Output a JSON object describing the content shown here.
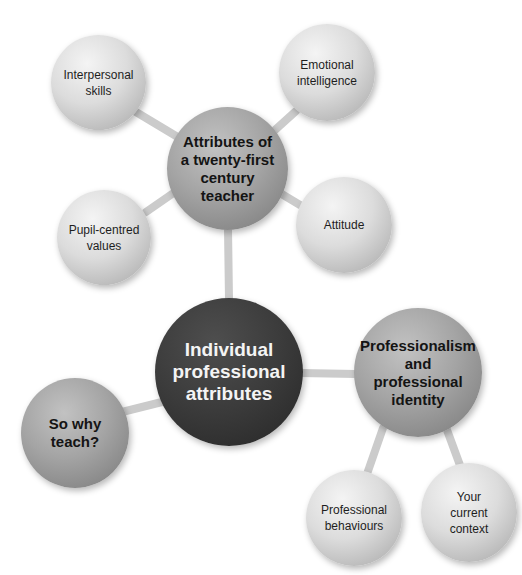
{
  "diagram": {
    "type": "mind-map",
    "colors": {
      "background": "#ffffff",
      "connector": "#cacaca",
      "center_node": "#3a3a3a",
      "primary_node": "#9a9a9a",
      "secondary_node": "#d2d2d2"
    },
    "center": {
      "id": "individual",
      "label": "Individual\nprofessional\nattributes"
    },
    "nodes": [
      {
        "id": "attributes",
        "label": "Attributes of\na twenty-first\ncentury\nteacher",
        "level": "primary",
        "parent": "individual"
      },
      {
        "id": "professionalism",
        "label": "Professionalism\nand professional\nidentity",
        "level": "primary",
        "parent": "individual"
      },
      {
        "id": "so-why-teach",
        "label": "So why\nteach?",
        "level": "primary",
        "parent": "individual"
      },
      {
        "id": "interpersonal",
        "label": "Interpersonal\nskills",
        "level": "secondary",
        "parent": "attributes"
      },
      {
        "id": "emotional",
        "label": "Emotional\nintelligence",
        "level": "secondary",
        "parent": "attributes"
      },
      {
        "id": "pupil-centred",
        "label": "Pupil-centred\nvalues",
        "level": "secondary",
        "parent": "attributes"
      },
      {
        "id": "attitude",
        "label": "Attitude",
        "level": "secondary",
        "parent": "attributes"
      },
      {
        "id": "behaviours",
        "label": "Professional\nbehaviours",
        "level": "secondary",
        "parent": "professionalism"
      },
      {
        "id": "context",
        "label": "Your\ncurrent\ncontext",
        "level": "secondary",
        "parent": "professionalism"
      }
    ]
  }
}
